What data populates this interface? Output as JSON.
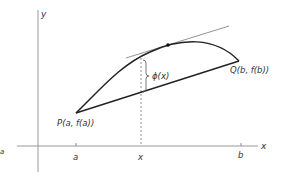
{
  "diagram": {
    "axes": {
      "x_label": "x",
      "y_label": "y",
      "ticks": [
        {
          "id": "a",
          "label": "a"
        },
        {
          "id": "x",
          "label": "x"
        },
        {
          "id": "b",
          "label": "b"
        }
      ]
    },
    "points": {
      "P": {
        "label": "P(a, f(a))"
      },
      "Q": {
        "label": "Q(b, f(b))"
      }
    },
    "annotations": {
      "phi": "ϕ(x)",
      "margin_fragment": "a"
    },
    "colors": {
      "curve": "#222222",
      "axis": "#888888",
      "tangent": "#777777",
      "text": "#333333"
    }
  }
}
